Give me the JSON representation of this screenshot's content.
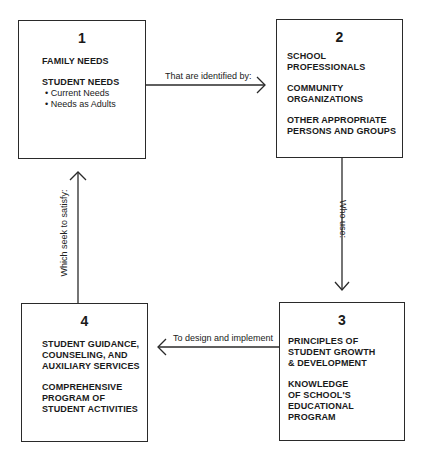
{
  "diagram": {
    "nodes": [
      {
        "id": "1",
        "number": "1",
        "groups": [
          {
            "title": "FAMILY NEEDS",
            "items": []
          },
          {
            "title": "STUDENT NEEDS",
            "items": [
              "• Current Needs",
              "• Needs as Adults"
            ]
          }
        ]
      },
      {
        "id": "2",
        "number": "2",
        "groups": [
          {
            "title": "SCHOOL\nPROFESSIONALS",
            "items": []
          },
          {
            "title": "COMMUNITY\nORGANIZATIONS",
            "items": []
          },
          {
            "title": "OTHER APPROPRIATE\nPERSONS AND GROUPS",
            "items": []
          }
        ]
      },
      {
        "id": "3",
        "number": "3",
        "groups": [
          {
            "title": "PRINCIPLES OF\nSTUDENT GROWTH\n& DEVELOPMENT",
            "items": []
          },
          {
            "title": "KNOWLEDGE\nOF SCHOOL'S\nEDUCATIONAL\nPROGRAM",
            "items": []
          }
        ]
      },
      {
        "id": "4",
        "number": "4",
        "groups": [
          {
            "title": "STUDENT GUIDANCE,\nCOUNSELING, AND\nAUXILIARY SERVICES",
            "items": []
          },
          {
            "title": "COMPREHENSIVE\nPROGRAM OF\nSTUDENT ACTIVITIES",
            "items": []
          }
        ]
      }
    ],
    "edges": [
      {
        "from": "1",
        "to": "2",
        "label": "That are identified by:"
      },
      {
        "from": "2",
        "to": "3",
        "label": "Who use:"
      },
      {
        "from": "3",
        "to": "4",
        "label": "To design and implement"
      },
      {
        "from": "4",
        "to": "1",
        "label": "Which seek to satisfy:"
      }
    ],
    "colors": {
      "line": "#2a2a2a",
      "text": "#1a1a1a",
      "background": "#ffffff"
    }
  }
}
